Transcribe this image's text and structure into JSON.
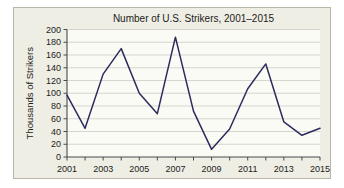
{
  "chart_data": {
    "type": "line",
    "title": "Number of U.S. Strikers, 2001–2015",
    "xlabel": "",
    "ylabel": "Thousands of Strikers",
    "x": [
      2001,
      2002,
      2003,
      2004,
      2005,
      2006,
      2007,
      2008,
      2009,
      2010,
      2011,
      2012,
      2013,
      2014,
      2015
    ],
    "values": [
      97,
      45,
      130,
      170,
      100,
      68,
      188,
      72,
      12,
      44,
      107,
      146,
      55,
      34,
      45
    ],
    "xlim": [
      2001,
      2015
    ],
    "ylim": [
      0,
      200
    ],
    "ytick_labels": [
      "200",
      "180",
      "160",
      "140",
      "120",
      "100",
      "80",
      "60",
      "40",
      "20",
      "0"
    ],
    "ytick_values": [
      200,
      180,
      160,
      140,
      120,
      100,
      80,
      60,
      40,
      20,
      0
    ],
    "xtick_labels": [
      "2001",
      "2003",
      "2005",
      "2007",
      "2009",
      "2011",
      "2013",
      "2015"
    ],
    "xtick_values": [
      2001,
      2003,
      2005,
      2007,
      2009,
      2011,
      2013,
      2015
    ],
    "grid": "horizontal",
    "legend": "none",
    "series_color": "#2b2b5e",
    "background_color": "#efeee4",
    "plot_background_color": "#fbfbf6",
    "gridline_color": "#c7c6bd",
    "axis_color": "#4a4a4a"
  }
}
